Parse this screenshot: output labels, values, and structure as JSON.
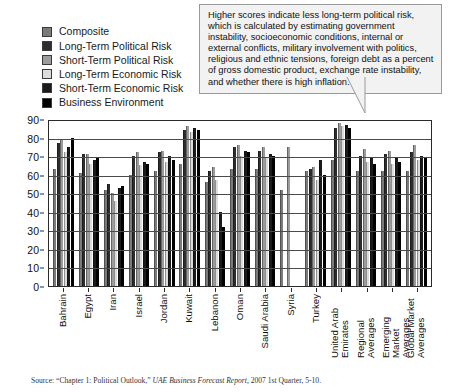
{
  "legend": {
    "items": [
      {
        "label": "Composite",
        "color": "#7b7b7b"
      },
      {
        "label": "Long-Term Political Risk",
        "color": "#2d2d2d"
      },
      {
        "label": "Short-Term Political Risk",
        "color": "#9c9c9c"
      },
      {
        "label": "Long-Term Economic Risk",
        "color": "#dcdcdc"
      },
      {
        "label": "Short-Term Economic Risk",
        "color": "#1b1b1b"
      },
      {
        "label": "Business Environment",
        "color": "#000000"
      }
    ]
  },
  "callout": {
    "text": "Higher scores indicate less long-term political risk, which is calculated by estimating government instability, socioeconomic conditions, internal or external conflicts, military involvement with politics, religious and ethnic tensions, foreign debt as a percent of gross domestic product, exchange rate instability, and whether there is high inflation."
  },
  "source": {
    "prefix": "Source: “Chapter 1: Political Outlook,” ",
    "italic": "UAE Business Forecast Report,",
    "suffix": " 2007 1st Quarter, 5-10."
  },
  "chart_data": {
    "type": "bar",
    "title": "",
    "xlabel": "",
    "ylabel": "",
    "ylim": [
      0,
      90
    ],
    "yticks": [
      0,
      10,
      20,
      30,
      40,
      50,
      60,
      70,
      80,
      90
    ],
    "grid": true,
    "legend_position": "top-left",
    "categories": [
      "Bahrain",
      "Egypt",
      "Iran",
      "Israel",
      "Jordan",
      "Kuwait",
      "Lebanon",
      "Oman",
      "Saudi Arabia",
      "Syria",
      "Turkey",
      "United Arab Emirates",
      "Regional Averages",
      "Emerging Market Averages",
      "Global Market Averages"
    ],
    "series": [
      {
        "name": "Composite",
        "color": "#7b7b7b",
        "values": [
          63,
          61,
          52,
          60,
          62,
          66,
          56,
          63,
          63,
          52,
          62,
          68,
          62,
          62,
          62
        ]
      },
      {
        "name": "Long-Term Political Risk",
        "color": "#2d2d2d",
        "values": [
          77,
          71,
          55,
          70,
          72,
          84,
          62,
          75,
          73,
          0,
          63,
          85,
          70,
          71,
          72
        ]
      },
      {
        "name": "Short-Term Political Risk",
        "color": "#9c9c9c",
        "values": [
          79,
          71,
          50,
          72,
          73,
          86,
          64,
          76,
          75,
          75,
          64,
          88,
          74,
          73,
          76
        ]
      },
      {
        "name": "Long-Term Economic Risk",
        "color": "#dcdcdc",
        "values": [
          72,
          66,
          46,
          65,
          67,
          83,
          57,
          70,
          69,
          0,
          57,
          86,
          67,
          66,
          68
        ]
      },
      {
        "name": "Short-Term Economic Risk",
        "color": "#1b1b1b",
        "values": [
          75,
          68,
          53,
          67,
          70,
          85,
          40,
          73,
          71,
          0,
          68,
          87,
          69,
          69,
          70
        ]
      },
      {
        "name": "Business Environment",
        "color": "#000000",
        "values": [
          80,
          69,
          54,
          66,
          68,
          84,
          32,
          72,
          70,
          0,
          60,
          85,
          66,
          67,
          69
        ]
      }
    ]
  }
}
